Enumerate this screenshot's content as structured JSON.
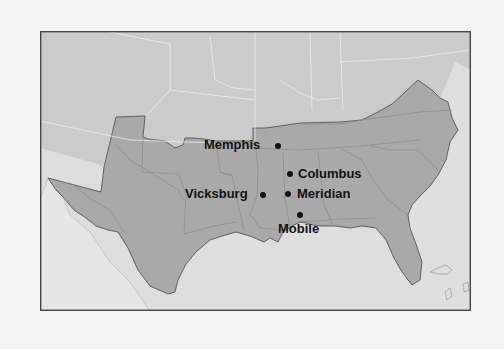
{
  "map": {
    "title": "",
    "colors": {
      "page_background": "#f4f4f4",
      "union_states": "#cbcbcb",
      "confederate_states": "#a9a9a9",
      "water": "#dedede",
      "foreign_land": "#e6e6e6",
      "state_borders": "#8a8a8a",
      "confederacy_border": "#555555",
      "frame": "#444444",
      "labels": "#111111"
    },
    "cities": [
      {
        "name": "Memphis",
        "label": "Memphis",
        "dot": [
          278,
          146
        ],
        "label_side": "left"
      },
      {
        "name": "Columbus",
        "label": "Columbus",
        "dot": [
          290,
          174
        ],
        "label_side": "right"
      },
      {
        "name": "Vicksburg",
        "label": "Vicksburg",
        "dot": [
          263,
          195
        ],
        "label_side": "left"
      },
      {
        "name": "Meridian",
        "label": "Meridian",
        "dot": [
          288,
          194
        ],
        "label_side": "right"
      },
      {
        "name": "Mobile",
        "label": "Mobile",
        "dot": [
          300,
          215
        ],
        "label_side": "below"
      }
    ]
  }
}
